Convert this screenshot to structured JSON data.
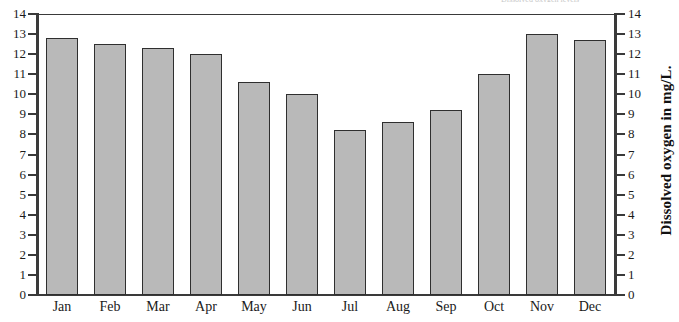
{
  "chart_data": {
    "type": "bar",
    "title": "Dissolved oxygen levels",
    "xlabel": "",
    "ylabel": "Dissolved oxygen in mg/L.",
    "ylabel_right": "Dissolved oxygen in mg/L.",
    "categories": [
      "Jan",
      "Feb",
      "Mar",
      "Apr",
      "May",
      "Jun",
      "Jul",
      "Aug",
      "Sep",
      "Oct",
      "Nov",
      "Dec"
    ],
    "values": [
      12.8,
      12.5,
      12.3,
      12.0,
      10.6,
      10.0,
      8.2,
      8.6,
      9.2,
      11.0,
      13.0,
      12.7
    ],
    "ylim": [
      0,
      14
    ],
    "ytick_labels": [
      "14",
      "13",
      "12",
      "11",
      "10",
      "9",
      "8",
      "7",
      "6",
      "5",
      "4",
      "3",
      "2",
      "1",
      "0"
    ],
    "ytick_values": [
      14,
      13,
      12,
      11,
      10,
      9,
      8,
      7,
      6,
      5,
      4,
      3,
      2,
      1,
      0
    ],
    "grid": false,
    "legend": "none",
    "dual_axis": true,
    "bar_fill_color": "#b9b9b9",
    "bar_edge_color": "#2f2f2f",
    "axis_color": "#3a3a3a",
    "background_color": "#ffffff"
  }
}
